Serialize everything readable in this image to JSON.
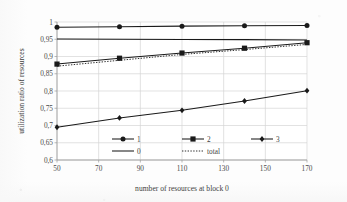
{
  "chart_data": {
    "type": "line",
    "title": "",
    "xlabel": "number of resources at block 0",
    "ylabel": "utilization ratio of resources",
    "x": [
      50,
      80,
      110,
      140,
      170
    ],
    "xlim": [
      50,
      170
    ],
    "ylim": [
      0.6,
      1.0
    ],
    "xticks": [
      50,
      70,
      90,
      110,
      130,
      150,
      170
    ],
    "xtick_labels": [
      "50",
      "70",
      "90",
      "110",
      "130",
      "150",
      "170"
    ],
    "yticks": [
      0.6,
      0.65,
      0.7,
      0.75,
      0.8,
      0.85,
      0.9,
      0.95,
      1.0
    ],
    "ytick_labels": [
      "0,6",
      "0,65",
      "0,7",
      "0,75",
      "0,8",
      "0,85",
      "0,9",
      "0,95",
      "1"
    ],
    "grid": true,
    "legend_position": "inside-bottom-center",
    "series": [
      {
        "name": "1",
        "marker": "circle",
        "style": "solid",
        "values": [
          0.985,
          0.986,
          0.988,
          0.989,
          0.99
        ]
      },
      {
        "name": "2",
        "marker": "square",
        "style": "solid",
        "values": [
          0.878,
          0.895,
          0.91,
          0.924,
          0.94
        ]
      },
      {
        "name": "3",
        "marker": "diamond",
        "style": "solid",
        "values": [
          0.695,
          0.722,
          0.744,
          0.771,
          0.801
        ]
      },
      {
        "name": "0",
        "marker": "none",
        "style": "solid",
        "values": [
          0.951,
          0.95,
          0.949,
          0.949,
          0.948
        ]
      },
      {
        "name": "total",
        "marker": "none",
        "style": "dotted",
        "values": [
          0.872,
          0.889,
          0.906,
          0.92,
          0.935
        ]
      }
    ]
  },
  "axes": {
    "x_title": "number of resources at block 0",
    "y_title": "utilization ratio of resources"
  },
  "legend": {
    "entries": [
      {
        "label": "1",
        "marker": "circle",
        "style": "solid"
      },
      {
        "label": "2",
        "marker": "square",
        "style": "solid"
      },
      {
        "label": "3",
        "marker": "diamond",
        "style": "solid"
      },
      {
        "label": "0",
        "marker": "none",
        "style": "solid"
      },
      {
        "label": "total",
        "marker": "none",
        "style": "dotted"
      }
    ]
  },
  "colors": {
    "series_line": "#1a1a1a",
    "grid": "#d6d6d6",
    "axis": "#9a9a9a",
    "text": "#444444",
    "background": "#ffffff"
  }
}
